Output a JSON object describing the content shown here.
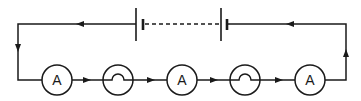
{
  "diagram": {
    "type": "series circuit",
    "battery": {
      "cells": 2,
      "connection_between_cells": "dashed"
    },
    "components": [
      {
        "kind": "ammeter",
        "label": "A"
      },
      {
        "kind": "lamp",
        "label": ""
      },
      {
        "kind": "ammeter",
        "label": "A"
      },
      {
        "kind": "lamp",
        "label": ""
      },
      {
        "kind": "ammeter",
        "label": "A"
      }
    ],
    "current_direction": "clockwise-from-right: up right side, left along top, down left side, right along bottom",
    "colors": {
      "line": "#1a1a1a",
      "background": "#ffffff"
    }
  }
}
